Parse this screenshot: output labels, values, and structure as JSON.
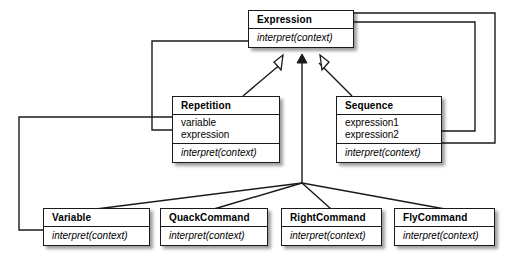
{
  "diagram": {
    "type": "uml-class-diagram",
    "background_color": "#ffffff",
    "line_color": "#1a1a1a",
    "box_fill": "#ffffff",
    "shadow": true
  },
  "classes": {
    "expression": {
      "name": "Expression",
      "attributes": [],
      "operations": [
        "interpret(context)"
      ]
    },
    "repetition": {
      "name": "Repetition",
      "attributes": [
        "variable",
        "expression"
      ],
      "operations": [
        "interpret(context)"
      ]
    },
    "sequence": {
      "name": "Sequence",
      "attributes": [
        "expression1",
        "expression2"
      ],
      "operations": [
        "interpret(context)"
      ]
    },
    "variable": {
      "name": "Variable",
      "attributes": [],
      "operations": [
        "interpret(context)"
      ]
    },
    "quackcommand": {
      "name": "QuackCommand",
      "attributes": [],
      "operations": [
        "interpret(context)"
      ]
    },
    "rightcommand": {
      "name": "RightCommand",
      "attributes": [],
      "operations": [
        "interpret(context)"
      ]
    },
    "flycommand": {
      "name": "FlyCommand",
      "attributes": [],
      "operations": [
        "interpret(context)"
      ]
    }
  },
  "relationships": [
    {
      "kind": "generalization",
      "from": "Repetition",
      "to": "Expression",
      "arrowhead": "hollow-triangle"
    },
    {
      "kind": "generalization",
      "from": "Sequence",
      "to": "Expression",
      "arrowhead": "hollow-triangle"
    },
    {
      "kind": "generalization",
      "from": "Variable",
      "to": "Expression",
      "arrowhead": "solid-triangle"
    },
    {
      "kind": "generalization",
      "from": "QuackCommand",
      "to": "Expression",
      "arrowhead": "solid-triangle"
    },
    {
      "kind": "generalization",
      "from": "RightCommand",
      "to": "Expression",
      "arrowhead": "solid-triangle"
    },
    {
      "kind": "generalization",
      "from": "FlyCommand",
      "to": "Expression",
      "arrowhead": "solid-triangle"
    },
    {
      "kind": "association",
      "from": "Expression",
      "to": "Repetition",
      "routing": "orthogonal-left"
    },
    {
      "kind": "association",
      "from": "Expression",
      "to": "Variable",
      "routing": "orthogonal-far-left"
    },
    {
      "kind": "association",
      "from": "Expression",
      "to": "Sequence",
      "routing": "orthogonal-right-inner"
    },
    {
      "kind": "association",
      "from": "Expression",
      "to": "Sequence",
      "routing": "orthogonal-right-outer"
    }
  ]
}
